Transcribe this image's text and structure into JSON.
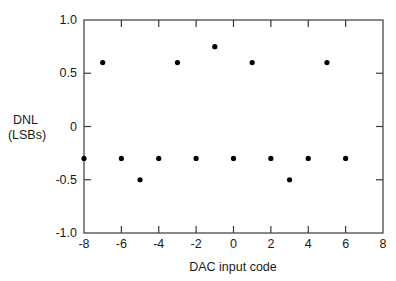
{
  "chart_data": {
    "type": "scatter",
    "title": "",
    "xlabel": "DAC input code",
    "ylabel": "DNL\n(LSBs)",
    "ylabel_lines": [
      "DNL",
      "(LSBs)"
    ],
    "xlim": [
      -8,
      8
    ],
    "ylim": [
      -1.0,
      1.0
    ],
    "xticks": [
      -8,
      -6,
      -4,
      -2,
      0,
      2,
      4,
      6,
      8
    ],
    "xtick_labels": [
      "-8",
      "-6",
      "-4",
      "-2",
      "0",
      "2",
      "4",
      "6",
      "8"
    ],
    "yticks": [
      1.0,
      0.5,
      0,
      -0.5,
      -1.0
    ],
    "ytick_labels": [
      "1.0",
      "0.5",
      "0",
      "-0.5",
      "-1.0"
    ],
    "grid": false,
    "legend": null,
    "series": [
      {
        "name": "DNL",
        "x": [
          -8,
          -7,
          -6,
          -5,
          -4,
          -3,
          -2,
          -1,
          0,
          1,
          2,
          3,
          4,
          5,
          6
        ],
        "y": [
          -0.3,
          0.6,
          -0.3,
          -0.5,
          -0.3,
          0.6,
          -0.3,
          0.75,
          -0.3,
          0.6,
          -0.3,
          -0.5,
          -0.3,
          0.6,
          -0.3
        ],
        "marker": "circle",
        "color": "#000000"
      }
    ]
  },
  "style": {
    "frame_color": "#3a3a3a",
    "dot_color": "#000000",
    "background": "#ffffff"
  }
}
